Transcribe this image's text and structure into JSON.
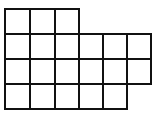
{
  "diagram": {
    "type": "grid-shape",
    "line_color": "#111111",
    "fill_color": "#ffffff",
    "origin_x": 5,
    "origin_y": 9,
    "cell_size": 24.4,
    "rows": [
      {
        "row": 0,
        "cols": [
          0,
          1,
          2
        ]
      },
      {
        "row": 1,
        "cols": [
          0,
          1,
          2,
          3,
          4,
          5
        ]
      },
      {
        "row": 2,
        "cols": [
          0,
          1,
          2,
          3,
          4,
          5
        ]
      },
      {
        "row": 3,
        "cols": [
          0,
          1,
          2,
          3,
          4
        ]
      }
    ],
    "total_cells": 20
  }
}
